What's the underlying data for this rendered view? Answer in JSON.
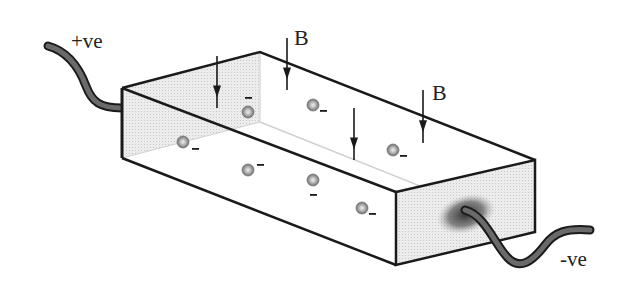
{
  "diagram": {
    "title": "",
    "labels": {
      "positive_terminal": "+ve",
      "negative_terminal": "-ve",
      "field_label_1": "B",
      "field_label_2": "B"
    },
    "electron_sign": "–",
    "colors": {
      "outline": "#1a1a1a",
      "shaded_face": "#e6e6e6",
      "wire": "#3a3a3a",
      "electron": "#8a8a8a"
    },
    "electrons": [
      {
        "x": 248,
        "y": 112,
        "sign_dx": 0,
        "sign_dy": -14
      },
      {
        "x": 313,
        "y": 105,
        "sign_dx": 10,
        "sign_dy": 6
      },
      {
        "x": 183,
        "y": 142,
        "sign_dx": 12,
        "sign_dy": 7
      },
      {
        "x": 393,
        "y": 150,
        "sign_dx": 10,
        "sign_dy": 6
      },
      {
        "x": 248,
        "y": 170,
        "sign_dx": 12,
        "sign_dy": -5
      },
      {
        "x": 313,
        "y": 180,
        "sign_dx": 0,
        "sign_dy": 15
      },
      {
        "x": 362,
        "y": 208,
        "sign_dx": 10,
        "sign_dy": 6
      }
    ],
    "field_arrows": [
      {
        "x": 217,
        "y1": 56,
        "y2": 108
      },
      {
        "x": 287,
        "y1": 38,
        "y2": 90
      },
      {
        "x": 354,
        "y1": 108,
        "y2": 160
      },
      {
        "x": 423,
        "y1": 90,
        "y2": 143
      }
    ]
  }
}
